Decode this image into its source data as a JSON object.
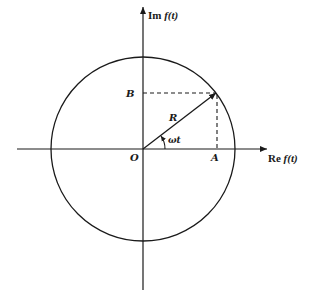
{
  "diagram": {
    "axes": {
      "imaginary_label_prefix": "Im",
      "imaginary_label_func": "f(t)",
      "real_label_prefix": "Re",
      "real_label_func": "f(t)"
    },
    "points": {
      "origin": "O",
      "projection_real": "A",
      "projection_imag": "B"
    },
    "vector_label": "R",
    "angle_label": "ωt",
    "colors": {
      "stroke": "#1a1a1a",
      "background": "#ffffff"
    }
  }
}
